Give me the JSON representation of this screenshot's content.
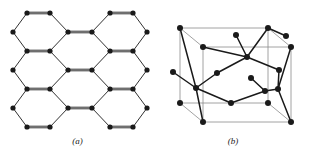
{
  "figure": {
    "background_color": "#ffffff",
    "ink_color": "#1a1a1a",
    "cube_edge_color": "#8a8a8a",
    "width": 311,
    "height": 150,
    "panels": [
      {
        "id": "a",
        "caption": "(a)",
        "kind": "honeycomb-lattice-2d",
        "description": "Planar honeycomb (hexagonal) network of filled circular atoms joined by bonds; horizontal bonds drawn as double lines, slanted bonds as single lines.",
        "atom_radius": 2.6,
        "bond_single_width": 0.9,
        "bond_double_gap": 1.6,
        "atom_count": 32,
        "atoms": [
          {
            "id": "a1",
            "x": 27,
            "y": 13
          },
          {
            "id": "a2",
            "x": 50,
            "y": 13
          },
          {
            "id": "a3",
            "x": 110,
            "y": 13
          },
          {
            "id": "a4",
            "x": 133,
            "y": 13
          },
          {
            "id": "a5",
            "x": 13,
            "y": 32
          },
          {
            "id": "a6",
            "x": 68,
            "y": 32
          },
          {
            "id": "a7",
            "x": 92,
            "y": 32
          },
          {
            "id": "a8",
            "x": 147,
            "y": 32
          },
          {
            "id": "a9",
            "x": 27,
            "y": 51
          },
          {
            "id": "a10",
            "x": 50,
            "y": 51
          },
          {
            "id": "a11",
            "x": 110,
            "y": 51
          },
          {
            "id": "a12",
            "x": 133,
            "y": 51
          },
          {
            "id": "a13",
            "x": 13,
            "y": 70
          },
          {
            "id": "a14",
            "x": 68,
            "y": 70
          },
          {
            "id": "a15",
            "x": 92,
            "y": 70
          },
          {
            "id": "a16",
            "x": 147,
            "y": 70
          },
          {
            "id": "a17",
            "x": 27,
            "y": 89
          },
          {
            "id": "a18",
            "x": 50,
            "y": 89
          },
          {
            "id": "a19",
            "x": 110,
            "y": 89
          },
          {
            "id": "a20",
            "x": 133,
            "y": 89
          },
          {
            "id": "a21",
            "x": 13,
            "y": 108
          },
          {
            "id": "a22",
            "x": 68,
            "y": 108
          },
          {
            "id": "a23",
            "x": 92,
            "y": 108
          },
          {
            "id": "a24",
            "x": 147,
            "y": 108
          },
          {
            "id": "a25",
            "x": 27,
            "y": 127
          },
          {
            "id": "a26",
            "x": 50,
            "y": 127
          },
          {
            "id": "a27",
            "x": 110,
            "y": 127
          },
          {
            "id": "a28",
            "x": 133,
            "y": 127
          }
        ],
        "bonds_double": [
          [
            "a1",
            "a2"
          ],
          [
            "a3",
            "a4"
          ],
          [
            "a6",
            "a7"
          ],
          [
            "a9",
            "a10"
          ],
          [
            "a11",
            "a12"
          ],
          [
            "a14",
            "a15"
          ],
          [
            "a17",
            "a18"
          ],
          [
            "a19",
            "a20"
          ],
          [
            "a22",
            "a23"
          ],
          [
            "a25",
            "a26"
          ],
          [
            "a27",
            "a28"
          ]
        ],
        "bonds_single": [
          [
            "a5",
            "a1"
          ],
          [
            "a2",
            "a6"
          ],
          [
            "a7",
            "a3"
          ],
          [
            "a4",
            "a8"
          ],
          [
            "a5",
            "a9"
          ],
          [
            "a6",
            "a10"
          ],
          [
            "a7",
            "a11"
          ],
          [
            "a8",
            "a12"
          ],
          [
            "a13",
            "a9"
          ],
          [
            "a10",
            "a14"
          ],
          [
            "a15",
            "a11"
          ],
          [
            "a12",
            "a16"
          ],
          [
            "a13",
            "a17"
          ],
          [
            "a14",
            "a18"
          ],
          [
            "a15",
            "a19"
          ],
          [
            "a16",
            "a20"
          ],
          [
            "a21",
            "a17"
          ],
          [
            "a18",
            "a22"
          ],
          [
            "a23",
            "a19"
          ],
          [
            "a20",
            "a24"
          ],
          [
            "a21",
            "a25"
          ],
          [
            "a22",
            "a26"
          ],
          [
            "a23",
            "a27"
          ],
          [
            "a24",
            "a28"
          ]
        ]
      },
      {
        "id": "b",
        "caption": "(b)",
        "kind": "unit-cell-3d",
        "description": "Three-dimensional unit cell drawn as a thin grey parallelepiped (cube in oblique projection) containing a bold tetrahedrally-bonded atom network.",
        "atom_radius": 3.0,
        "bond_width": 1.5,
        "cube_edge_width": 0.8,
        "cube_vertices": {
          "front_bottom_left": {
            "x": 25,
            "y": 103
          },
          "front_bottom_right": {
            "x": 113,
            "y": 103
          },
          "front_top_left": {
            "x": 25,
            "y": 28
          },
          "front_top_right": {
            "x": 113,
            "y": 28
          },
          "back_bottom_left": {
            "x": 48,
            "y": 122
          },
          "back_bottom_right": {
            "x": 136,
            "y": 122
          },
          "back_top_left": {
            "x": 48,
            "y": 47
          },
          "back_top_right": {
            "x": 136,
            "y": 47
          }
        },
        "atoms": [
          {
            "id": "b1",
            "x": 25,
            "y": 28,
            "label": "front-top-left-corner"
          },
          {
            "id": "b2",
            "x": 113,
            "y": 28,
            "label": "front-top-right-corner"
          },
          {
            "id": "b3",
            "x": 48,
            "y": 47,
            "label": "back-top-left-corner"
          },
          {
            "id": "b4",
            "x": 136,
            "y": 47,
            "label": "back-top-right-corner"
          },
          {
            "id": "b5",
            "x": 25,
            "y": 103,
            "label": "front-bottom-left-corner"
          },
          {
            "id": "b6",
            "x": 113,
            "y": 103,
            "label": "front-bottom-right-corner"
          },
          {
            "id": "b7",
            "x": 48,
            "y": 122,
            "label": "back-bottom-left-corner"
          },
          {
            "id": "b8",
            "x": 136,
            "y": 122,
            "label": "back-bottom-right-corner"
          },
          {
            "id": "b9",
            "x": 81,
            "y": 35,
            "label": "top-interior-a"
          },
          {
            "id": "b10",
            "x": 92,
            "y": 57,
            "label": "upper-interior-hub"
          },
          {
            "id": "b11",
            "x": 62,
            "y": 73,
            "label": "mid-left-interior"
          },
          {
            "id": "b12",
            "x": 124,
            "y": 70,
            "label": "mid-right-interior"
          },
          {
            "id": "b13",
            "x": 41,
            "y": 88,
            "label": "lower-left-hub"
          },
          {
            "id": "b14",
            "x": 18,
            "y": 72,
            "label": "left-outer-satellite"
          },
          {
            "id": "b15",
            "x": 110,
            "y": 91,
            "label": "lower-right-hub"
          },
          {
            "id": "b16",
            "x": 123,
            "y": 89,
            "label": "lower-right-hub-2"
          },
          {
            "id": "b17",
            "x": 96,
            "y": 78,
            "label": "right-interior-satellite"
          },
          {
            "id": "b18",
            "x": 76,
            "y": 103,
            "label": "bottom-interior"
          },
          {
            "id": "b19",
            "x": 131,
            "y": 36,
            "label": "upper-right-satellite"
          }
        ],
        "bonds": [
          [
            "b1",
            "b13"
          ],
          [
            "b14",
            "b13"
          ],
          [
            "b13",
            "b11"
          ],
          [
            "b13",
            "b18"
          ],
          [
            "b13",
            "b7"
          ],
          [
            "b11",
            "b10"
          ],
          [
            "b10",
            "b9"
          ],
          [
            "b10",
            "b2"
          ],
          [
            "b10",
            "b3"
          ],
          [
            "b10",
            "b12"
          ],
          [
            "b12",
            "b16"
          ],
          [
            "b16",
            "b15"
          ],
          [
            "b16",
            "b4"
          ],
          [
            "b16",
            "b8"
          ],
          [
            "b15",
            "b18"
          ],
          [
            "b15",
            "b17"
          ],
          [
            "b2",
            "b19"
          ]
        ],
        "cube_edges": [
          [
            "front_top_left",
            "front_top_right"
          ],
          [
            "front_top_right",
            "front_bottom_right"
          ],
          [
            "front_bottom_right",
            "front_bottom_left"
          ],
          [
            "front_bottom_left",
            "front_top_left"
          ],
          [
            "back_top_left",
            "back_top_right"
          ],
          [
            "back_top_right",
            "back_bottom_right"
          ],
          [
            "back_bottom_right",
            "back_bottom_left"
          ],
          [
            "back_bottom_left",
            "back_top_left"
          ],
          [
            "front_top_left",
            "back_top_left"
          ],
          [
            "front_top_right",
            "back_top_right"
          ],
          [
            "front_bottom_left",
            "back_bottom_left"
          ],
          [
            "front_bottom_right",
            "back_bottom_right"
          ]
        ]
      }
    ]
  }
}
